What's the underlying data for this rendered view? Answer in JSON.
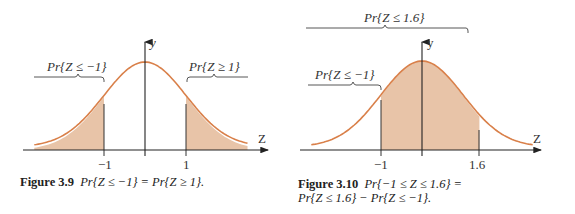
{
  "figures": [
    {
      "id": "fig-3-9",
      "caption_label": "Figure 3.9",
      "caption_text": "Pr{Z ≤ −1} = Pr{Z ≥ 1}.",
      "x_axis_label": "Z",
      "y_axis_label": "y",
      "tick_labels": [
        "−1",
        "1"
      ],
      "brace_labels": [
        "Pr{Z ≤ −1}",
        "Pr{Z ≥ 1}"
      ]
    },
    {
      "id": "fig-3-10",
      "caption_label": "Figure 3.10",
      "caption_text_line1": "Pr{−1 ≤ Z ≤ 1.6} =",
      "caption_text_line2": "Pr{Z ≤ 1.6} − Pr{Z ≤ −1}.",
      "x_axis_label": "Z",
      "y_axis_label": "y",
      "tick_labels": [
        "−1",
        "1.6"
      ],
      "brace_labels": [
        "Pr{Z ≤ 1.6}",
        "Pr{Z ≤ −1}"
      ]
    }
  ],
  "colors": {
    "curve": "#d9804a",
    "shade": "#e8c4a8",
    "axis": "#333333"
  },
  "chart_data": [
    {
      "type": "area",
      "title": "Figure 3.9 Pr{Z ≤ −1} = Pr{Z ≥ 1}.",
      "xlabel": "Z",
      "ylabel": "y",
      "curve": "standard normal density",
      "shaded_regions": [
        [
          -3.5,
          -1
        ],
        [
          1,
          3.5
        ]
      ],
      "x_ticks": [
        -1,
        1
      ],
      "annotations": [
        "Pr{Z ≤ −1}",
        "Pr{Z ≥ 1}"
      ]
    },
    {
      "type": "area",
      "title": "Figure 3.10 Pr{−1 ≤ Z ≤ 1.6} = Pr{Z ≤ 1.6} − Pr{Z ≤ −1}.",
      "xlabel": "Z",
      "ylabel": "y",
      "curve": "standard normal density",
      "shaded_regions": [
        [
          -1,
          1.6
        ]
      ],
      "x_ticks": [
        -1,
        1.6
      ],
      "annotations": [
        "Pr{Z ≤ 1.6}",
        "Pr{Z ≤ −1}"
      ]
    }
  ]
}
